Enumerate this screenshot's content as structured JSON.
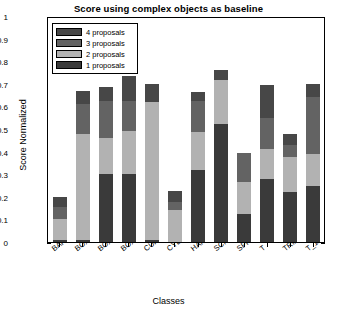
{
  "chart_data": {
    "type": "bar",
    "title": "Score using complex objects as baseline",
    "xlabel": "Classes",
    "ylabel": "Score Normalized",
    "stacked": true,
    "grid": false,
    "legend_position": "upper-left",
    "ylim": [
      0,
      1
    ],
    "yticks": [
      "0",
      "0.1",
      "0.2",
      "0.3",
      "0.4",
      "0.5",
      "0.6",
      "0.7",
      "0.8",
      "0.9",
      "1"
    ],
    "categories": [
      "BAR",
      "BOX",
      "BOX_1",
      "BOX_2",
      "CUP",
      "CYLINDER",
      "HAMMER",
      "SCISSOR",
      "SPHERE",
      "T",
      "TRIANGLE",
      "T_1"
    ],
    "series": [
      {
        "name": "1 proposals",
        "color": "#3a3a3a",
        "values": [
          0.01,
          0.01,
          0.3,
          0.3,
          0.01,
          0.0,
          0.32,
          0.52,
          0.125,
          0.28,
          0.22,
          0.25
        ]
      },
      {
        "name": "2 proposals",
        "color": "#b2b2b2",
        "values": [
          0.09,
          0.47,
          0.16,
          0.19,
          0.61,
          0.14,
          0.165,
          0.195,
          0.14,
          0.13,
          0.155,
          0.14
        ]
      },
      {
        "name": "3 proposals",
        "color": "#636363",
        "values": [
          0.055,
          0.13,
          0.165,
          0.135,
          0.0,
          0.035,
          0.14,
          0.0,
          0.13,
          0.14,
          0.055,
          0.25
        ]
      },
      {
        "name": "4 proposals",
        "color": "#474747",
        "values": [
          0.045,
          0.06,
          0.06,
          0.11,
          0.08,
          0.05,
          0.04,
          0.045,
          0.0,
          0.145,
          0.05,
          0.06
        ]
      }
    ],
    "totals": [
      0.2,
      0.67,
      0.685,
      0.735,
      0.7,
      0.225,
      0.665,
      0.76,
      0.395,
      0.695,
      0.48,
      0.7
    ]
  },
  "legend": {
    "entries": [
      {
        "label": "4 proposals",
        "color": "#474747"
      },
      {
        "label": "3 proposals",
        "color": "#636363"
      },
      {
        "label": "2 proposals",
        "color": "#b2b2b2"
      },
      {
        "label": "1 proposals",
        "color": "#3a3a3a"
      }
    ]
  }
}
